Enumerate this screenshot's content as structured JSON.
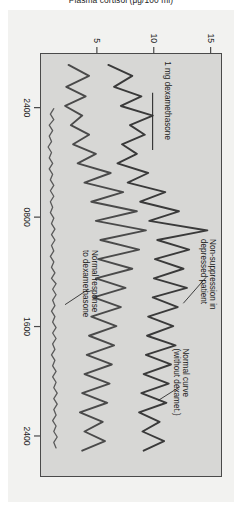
{
  "figure": {
    "background_color": "#f2f2f0",
    "plot_background_color": "#d7d7d5",
    "axis_color": "#4a4a4a"
  },
  "chart_data": {
    "type": "line",
    "title": "",
    "subtitle": "",
    "xlabel": "",
    "ylabel": "Plasma cortisol (μg/100 ml)",
    "xtick_labels": [
      "2400",
      "0800",
      "1600",
      "2400"
    ],
    "xtick_positions": [
      0,
      8,
      16,
      24
    ],
    "ytick_labels": [
      "15",
      "10",
      "5"
    ],
    "ytick_values": [
      15,
      10,
      5
    ],
    "ylim": [
      0,
      16
    ],
    "xlim": [
      -4,
      27
    ],
    "grid": false,
    "legend": "none",
    "series": [
      {
        "name": "Non-suppression in depressed patient",
        "color": "#3a3a3a",
        "width": 1.9,
        "x": [
          -3.2,
          -2.4,
          -1.6,
          -0.9,
          -0.2,
          0.5,
          1.2,
          1.9,
          2.6,
          3.3,
          4.0,
          4.7,
          5.4,
          6.1,
          6.8,
          7.5,
          8.2,
          8.9,
          9.6,
          10.3,
          11.0,
          11.7,
          12.4,
          13.1,
          13.8,
          14.5,
          15.2,
          15.9,
          16.6,
          17.3,
          18.0,
          18.7,
          19.4,
          20.1,
          20.8,
          21.5,
          22.2,
          22.9,
          23.6,
          24.3,
          25.0
        ],
        "y": [
          6.1,
          8.2,
          6.6,
          9.0,
          7.2,
          10.0,
          8.0,
          9.3,
          7.3,
          8.6,
          6.9,
          9.6,
          7.8,
          11.1,
          8.9,
          12.3,
          9.7,
          14.8,
          10.4,
          13.2,
          10.2,
          12.7,
          10.1,
          13.0,
          10.0,
          12.2,
          9.6,
          11.8,
          9.5,
          12.0,
          9.4,
          11.6,
          9.2,
          11.4,
          9.0,
          11.2,
          8.8,
          10.6,
          9.1,
          11.0,
          9.2
        ]
      },
      {
        "name": "Normal curve (without dexamet.)",
        "color": "#4a4a4a",
        "width": 1.9,
        "x": [
          -3.2,
          -2.4,
          -1.6,
          -0.9,
          -0.2,
          0.5,
          1.2,
          1.9,
          2.6,
          3.3,
          4.0,
          4.7,
          5.4,
          6.1,
          6.8,
          7.5,
          8.2,
          8.9,
          9.6,
          10.3,
          11.0,
          11.7,
          12.4,
          13.1,
          13.8,
          14.5,
          15.2,
          15.9,
          16.6,
          17.3,
          18.0,
          18.7,
          19.4,
          20.1,
          20.8,
          21.5,
          22.2,
          22.9,
          23.6,
          24.3,
          25.0
        ],
        "y": [
          2.6,
          4.4,
          2.4,
          4.1,
          2.3,
          3.8,
          2.8,
          4.4,
          3.0,
          5.0,
          3.4,
          6.3,
          4.0,
          7.4,
          4.6,
          8.6,
          5.0,
          9.4,
          5.4,
          8.8,
          5.2,
          8.2,
          5.0,
          7.6,
          4.8,
          7.2,
          4.6,
          6.8,
          4.4,
          6.6,
          4.2,
          6.4,
          4.0,
          6.2,
          3.8,
          6.0,
          3.6,
          5.6,
          4.0,
          5.8,
          3.8
        ]
      },
      {
        "name": "Normal response to dexamethasone",
        "color": "#5a5a5a",
        "width": 1.3,
        "x": [
          0.0,
          0.4,
          0.8,
          1.2,
          1.6,
          2.0,
          2.4,
          2.8,
          3.2,
          3.6,
          4.0,
          4.4,
          4.8,
          5.2,
          5.6,
          6.0,
          6.4,
          6.8,
          7.2,
          7.6,
          8.0,
          8.4,
          8.8,
          9.2,
          9.6,
          10.0,
          10.4,
          10.8,
          11.2,
          11.6,
          12.0,
          12.4,
          12.8,
          13.2,
          13.6,
          14.0,
          14.4,
          14.8,
          15.2,
          15.6,
          16.0,
          16.4,
          16.8,
          17.2,
          17.6,
          18.0,
          18.4,
          18.8,
          19.2,
          19.6,
          20.0,
          20.4,
          20.8,
          21.2,
          21.6,
          22.0,
          22.4,
          22.8,
          23.2,
          23.6,
          24.0,
          24.4,
          24.8
        ],
        "y": [
          1.3,
          1.0,
          1.3,
          0.9,
          1.2,
          0.9,
          1.1,
          0.8,
          1.1,
          0.9,
          1.2,
          0.9,
          1.2,
          1.0,
          1.3,
          1.0,
          1.3,
          1.0,
          1.2,
          1.0,
          1.3,
          1.1,
          1.4,
          1.1,
          1.4,
          1.1,
          1.3,
          1.0,
          1.3,
          1.1,
          1.4,
          1.1,
          1.5,
          1.2,
          1.5,
          1.2,
          1.4,
          1.1,
          1.4,
          1.2,
          1.5,
          1.2,
          1.5,
          1.2,
          1.4,
          1.1,
          1.4,
          1.2,
          1.5,
          1.2,
          1.5,
          1.3,
          1.6,
          1.3,
          1.6,
          1.3,
          1.5,
          1.2,
          1.5,
          1.3,
          1.6,
          1.3,
          1.5
        ]
      }
    ],
    "annotations": [
      {
        "id": "dexamethasone-dose",
        "text": "1 mg dexamethasone",
        "x": -1.6,
        "y": 9.9
      },
      {
        "id": "non-suppression",
        "text": "Non-suppression in\ndepressed patient",
        "x": 13.0,
        "y": 15.0
      },
      {
        "id": "normal-curve",
        "text": "Normal curve\n(without dexamet.)",
        "x": 19.2,
        "y": 12.5
      },
      {
        "id": "normal-response",
        "text": "Normal response\nto dexamethasone",
        "x": 11.6,
        "y": 4.3
      }
    ]
  }
}
